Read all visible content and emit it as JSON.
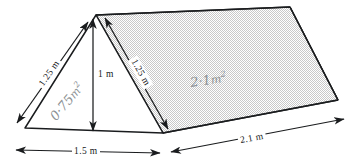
{
  "figure": {
    "shape_name": "triangular-prism",
    "background_color": "#ffffff",
    "outline_color": "#1a1c1e",
    "shaded_face_color": "#dcdcdc",
    "dimension_line_color": "#1a1c1e",
    "handwriting_color": "#8b8f93"
  },
  "dimensions": {
    "slant_left": "1.25 m",
    "slant_right": "1.25 m",
    "height": "1 m",
    "base_front": "1.5 m",
    "depth": "2.1 m"
  },
  "areas": {
    "triangle_face": {
      "value": "0·75",
      "unit": "m",
      "exponent": "2",
      "full": "0·75 m²"
    },
    "rectangle_face": {
      "value": "2·1",
      "unit": "m",
      "exponent": "2",
      "full": "2·1 m²"
    }
  },
  "geometry": {
    "apex": [
      96,
      15
    ],
    "front_bottom_left": [
      25,
      128
    ],
    "front_bottom_right": [
      163,
      133
    ],
    "back_ridge_right": [
      290,
      7
    ],
    "back_bottom_right": [
      338,
      100
    ]
  }
}
